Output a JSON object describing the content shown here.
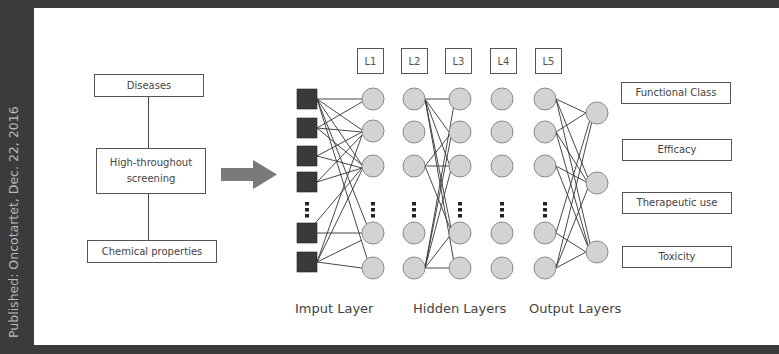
{
  "side_caption": "Published: Oncotartet, Dec. 22, 2016",
  "left_flow": {
    "top_box": "Diseases",
    "middle_box_line1": "High-throughout",
    "middle_box_line2": "screening",
    "bottom_box": "Chemical properties"
  },
  "layer_labels": [
    "L1",
    "L2",
    "L3",
    "L4",
    "L5"
  ],
  "outputs": [
    "Functional Class",
    "Efficacy",
    "Therapeutic use",
    "Toxicity"
  ],
  "captions": {
    "input": "Imput Layer",
    "hidden": "Hidden Layers",
    "output": "Output Layers"
  },
  "colors": {
    "background": "#3b3b3b",
    "panel": "#ffffff",
    "input_node": "#3a3a3a",
    "hidden_node": "#d3d3d3",
    "arrow": "#7a7a7a"
  }
}
